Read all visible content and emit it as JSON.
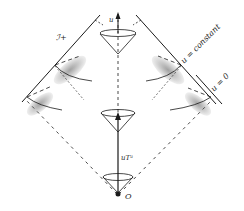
{
  "diagram": {
    "type": "spacetime light-cone diagram",
    "labels": {
      "scri_plus": "ℐ+",
      "u_arrow": "u",
      "u_constant": "u = constant",
      "u_zero": "u = 0",
      "uT": "uTᵃ",
      "origin": "O"
    },
    "colors": {
      "ink": "#1a1a1a",
      "background": "#ffffff"
    }
  }
}
